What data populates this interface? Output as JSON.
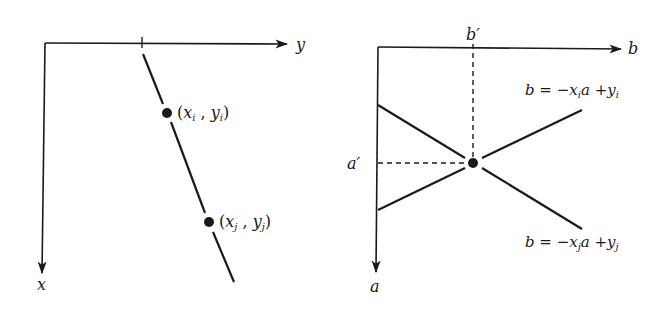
{
  "colors": {
    "ink": "#1a1a1a",
    "background": "#ffffff"
  },
  "left_panel": {
    "title": "data space",
    "horizontal_axis_label": "y",
    "vertical_axis_label": "x",
    "points": [
      {
        "label_open": "(",
        "var1": "x",
        "sub1": "i",
        "sep": " , ",
        "var2": "y",
        "sub2": "i",
        "label_close": ")"
      },
      {
        "label_open": "(",
        "var1": "x",
        "sub1": "j",
        "sep": " , ",
        "var2": "y",
        "sub2": "j",
        "label_close": ")"
      }
    ]
  },
  "right_panel": {
    "title": "parameter space",
    "horizontal_axis_label": "b",
    "vertical_axis_label": "a",
    "intersection_b_label": "b′",
    "intersection_a_label": "a′",
    "lines": [
      {
        "lhs": "b = −x",
        "sub": "i",
        "mid": "a +y",
        "sub2": "i"
      },
      {
        "lhs": "b = −x",
        "sub": "j",
        "mid": "a +y",
        "sub2": "j"
      }
    ]
  }
}
